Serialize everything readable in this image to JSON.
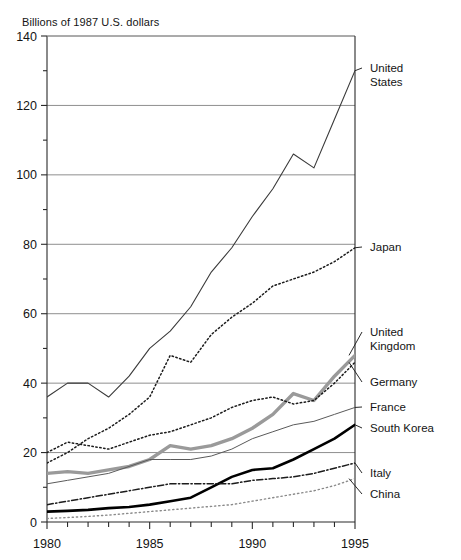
{
  "chart_data": {
    "type": "line",
    "title": "Billions of 1987 U.S. dollars",
    "xlabel": "",
    "ylabel": "Billions of 1987 U.S. dollars",
    "xlim": [
      1980,
      1995
    ],
    "ylim": [
      0,
      140
    ],
    "ytick_step": 20,
    "yminor_step": 10,
    "xtick_step": 1,
    "xlabel_step": 5,
    "grid": "horizontal-major",
    "legend_position": "right-labels-with-leader-lines",
    "x": [
      1980,
      1981,
      1982,
      1983,
      1984,
      1985,
      1986,
      1987,
      1988,
      1989,
      1990,
      1991,
      1992,
      1993,
      1994,
      1995
    ],
    "xtick_labels": [
      "1980",
      "",
      "",
      "",
      "",
      "1985",
      "",
      "",
      "",
      "",
      "1990",
      "",
      "",
      "",
      "",
      "1995"
    ],
    "ytick_labels": [
      "0",
      "20",
      "40",
      "60",
      "80",
      "100",
      "120",
      "140"
    ],
    "ytick_values": [
      0,
      20,
      40,
      60,
      80,
      100,
      120,
      140
    ],
    "series": [
      {
        "name": "United States",
        "label": "United States",
        "style": "solid-thin",
        "color": "#3a3a3a",
        "width": 1.1,
        "values": [
          36,
          40,
          40,
          36,
          42,
          50,
          55,
          62,
          72,
          79,
          88,
          96,
          106,
          102,
          116,
          130
        ]
      },
      {
        "name": "Japan",
        "label": "Japan",
        "style": "dotted",
        "color": "#1c1c1c",
        "width": 1.5,
        "values": [
          17,
          20,
          24,
          27,
          31,
          36,
          48,
          46,
          54,
          59,
          63,
          68,
          70,
          72,
          75,
          79
        ]
      },
      {
        "name": "United Kingdom",
        "label": "United Kingdom",
        "style": "solid-thick-gray",
        "color": "#9a9a9a",
        "width": 3.4,
        "values": [
          14,
          14.5,
          14,
          15,
          16,
          18,
          22,
          21,
          22,
          24,
          27,
          31,
          37,
          35,
          42,
          48
        ]
      },
      {
        "name": "Germany",
        "label": "Germany",
        "style": "dotted",
        "color": "#1c1c1c",
        "width": 1.5,
        "values": [
          20,
          23,
          22,
          21,
          23,
          25,
          26,
          28,
          30,
          33,
          35,
          36,
          34,
          35,
          40,
          46
        ]
      },
      {
        "name": "France",
        "label": "France",
        "style": "solid-thin",
        "color": "#5a5a5a",
        "width": 1.0,
        "values": [
          11,
          12,
          13,
          14,
          16,
          18,
          18,
          18,
          19,
          21,
          24,
          26,
          28,
          29,
          31,
          33
        ]
      },
      {
        "name": "South Korea",
        "label": "South Korea",
        "style": "solid-thick-black",
        "color": "#000000",
        "width": 2.6,
        "values": [
          3,
          3.2,
          3.5,
          4,
          4.3,
          5,
          6,
          7,
          10,
          13,
          15,
          15.5,
          18,
          21,
          24,
          28
        ]
      },
      {
        "name": "Italy",
        "label": "Italy",
        "style": "dash-dot",
        "color": "#1c1c1c",
        "width": 1.5,
        "values": [
          5,
          6,
          7,
          8,
          9,
          10,
          11,
          11,
          11,
          11,
          12,
          12.5,
          13,
          14,
          15.5,
          17
        ]
      },
      {
        "name": "China",
        "label": "China",
        "style": "dotted-light",
        "color": "#8a8a8a",
        "width": 1.4,
        "values": [
          1,
          1.3,
          1.6,
          2,
          2.5,
          3,
          3.5,
          4,
          4.5,
          5,
          6,
          7,
          8,
          9,
          10.5,
          12.5
        ]
      }
    ]
  },
  "legend": [
    {
      "label_line1": "United",
      "label_line2": "States",
      "name": "united-states"
    },
    {
      "label_line1": "Japan",
      "label_line2": "",
      "name": "japan"
    },
    {
      "label_line1": "United",
      "label_line2": "Kingdom",
      "name": "united-kingdom"
    },
    {
      "label_line1": "Germany",
      "label_line2": "",
      "name": "germany"
    },
    {
      "label_line1": "France",
      "label_line2": "",
      "name": "france"
    },
    {
      "label_line1": "South Korea",
      "label_line2": "",
      "name": "south-korea"
    },
    {
      "label_line1": "Italy",
      "label_line2": "",
      "name": "italy"
    },
    {
      "label_line1": "China",
      "label_line2": "",
      "name": "china"
    }
  ]
}
